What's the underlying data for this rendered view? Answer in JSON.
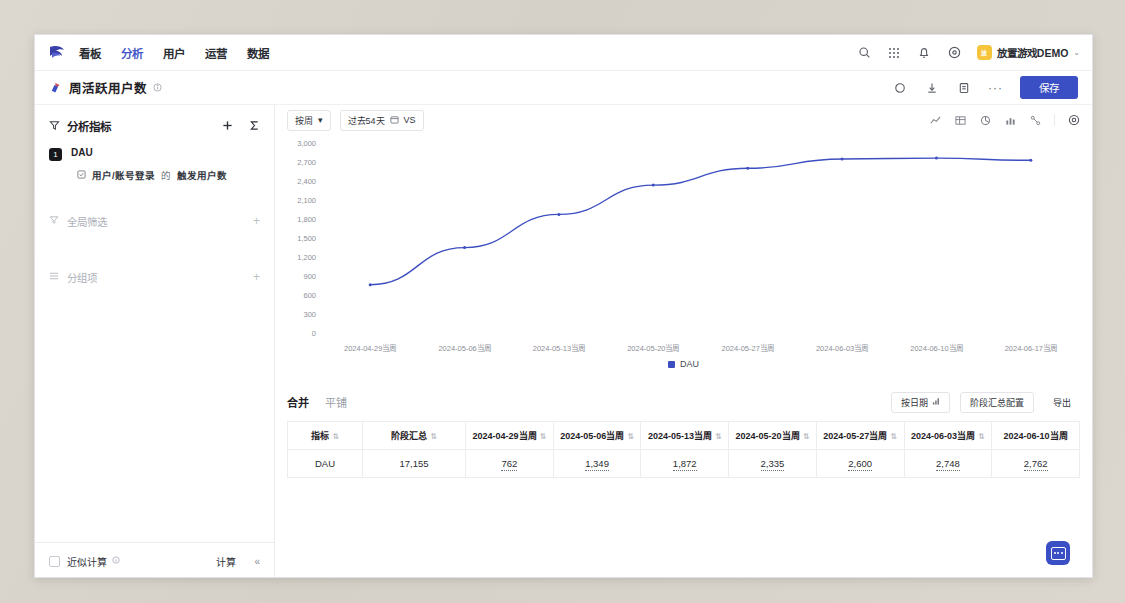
{
  "topnav": {
    "logo_icon": "brand-logo-icon",
    "items": [
      {
        "label": "看板",
        "active": false
      },
      {
        "label": "分析",
        "active": true
      },
      {
        "label": "用户",
        "active": false
      },
      {
        "label": "运营",
        "active": false
      },
      {
        "label": "数据",
        "active": false
      }
    ],
    "icons": [
      "search-icon",
      "grid-apps-icon",
      "bell-icon",
      "help-circle-icon"
    ],
    "account": {
      "avatar_text": "放",
      "name": "放置游戏DEMO",
      "caret": "⌄"
    }
  },
  "titlebar": {
    "pin_icon": "pin-icon",
    "title": "周活跃用户数",
    "info_icon": "info-circle-icon",
    "actions": [
      "refresh-icon",
      "download-icon",
      "copy-icon"
    ],
    "more_label": "···",
    "save_label": "保存"
  },
  "sidebar": {
    "head": {
      "icon": "filter-metrics-icon",
      "title": "分析指标",
      "add_icon": "plus-icon",
      "sigma_icon": "sigma-icon"
    },
    "metric": {
      "badge": "1",
      "name": "DAU",
      "event_icon": "event-icon",
      "event": "用户/账号登录",
      "connector": "的",
      "measure": "触发用户数"
    },
    "sections": [
      {
        "icon": "funnel-icon",
        "label": "全局筛选",
        "plus": "+"
      },
      {
        "icon": "group-icon",
        "label": "分组项",
        "plus": "+"
      }
    ],
    "footer": {
      "checkbox_label": "近似计算",
      "info_icon": "info-circle-icon",
      "calc_label": "计算",
      "collapse_label": "«"
    }
  },
  "toolbar": {
    "granularity": "按周",
    "granularity_caret": "▾",
    "date_range": "过去54天",
    "calendar_icon": "calendar-icon",
    "vs_label": "VS",
    "chart_icons": [
      "line-chart-icon",
      "table-icon",
      "pie-chart-icon",
      "bar-chart-icon",
      "flow-chart-icon"
    ],
    "settings_icon": "gear-icon"
  },
  "chart_data": {
    "type": "line",
    "title": "",
    "xlabel": "",
    "ylabel": "",
    "categories": [
      "2024-04-29当周",
      "2024-05-06当周",
      "2024-05-13当周",
      "2024-05-20当周",
      "2024-05-27当周",
      "2024-06-03当周",
      "2024-06-10当周",
      "2024-06-17当周"
    ],
    "series": [
      {
        "name": "DAU",
        "color": "#3d4fc0",
        "values": [
          762,
          1349,
          1872,
          2335,
          2600,
          2748,
          2762,
          2727
        ]
      }
    ],
    "yticks": [
      "3,000",
      "2,700",
      "2,400",
      "2,100",
      "1,800",
      "1,500",
      "1,200",
      "900",
      "600",
      "300",
      "0"
    ],
    "ylim": [
      0,
      3000
    ],
    "grid": false,
    "legend": {
      "position": "bottom",
      "entries": [
        "DAU"
      ]
    }
  },
  "table_panel": {
    "tabs": [
      {
        "label": "合并",
        "active": true
      },
      {
        "label": "平铺",
        "active": false
      }
    ],
    "buttons": [
      {
        "label": "按日期",
        "icon": "sort-icon"
      },
      {
        "label": "阶段汇总配置",
        "icon": ""
      },
      {
        "label": "导出",
        "icon": ""
      }
    ],
    "columns": [
      "指标",
      "阶段汇总",
      "2024-04-29当周",
      "2024-05-06当周",
      "2024-05-13当周",
      "2024-05-20当周",
      "2024-05-27当周",
      "2024-06-03当周",
      "2024-06-10当周"
    ],
    "rows": [
      [
        "DAU",
        "17,155",
        "762",
        "1,349",
        "1,872",
        "2,335",
        "2,600",
        "2,748",
        "2,762"
      ]
    ]
  },
  "fab": {
    "icon": "assistant-icon"
  },
  "colors": {
    "accent": "#3b4fc4",
    "line": "#3d4fc0",
    "nav_active": "#4558c9"
  }
}
